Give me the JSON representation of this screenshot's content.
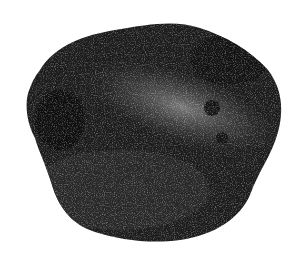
{
  "image": {
    "subject": "rock",
    "description": "A single dark speckled stone on a white background",
    "background_color": "#ffffff",
    "colors": {
      "dark": "#141414",
      "mid": "#3c3c3c",
      "light": "#9a9a9a"
    }
  }
}
